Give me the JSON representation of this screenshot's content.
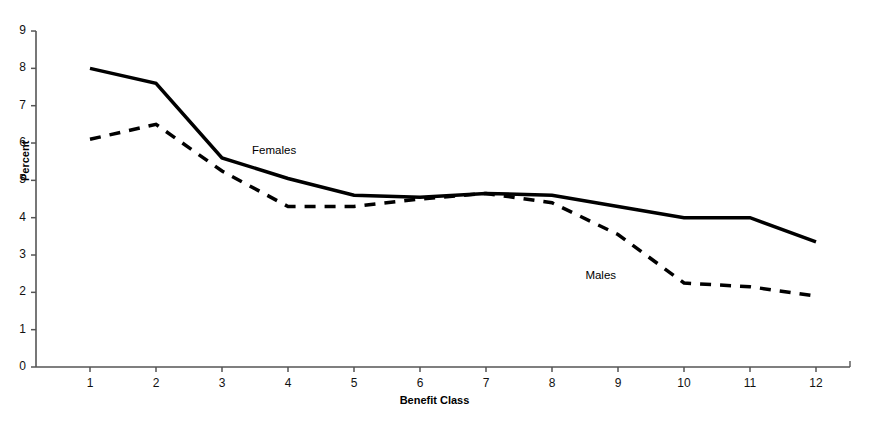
{
  "chart_data": {
    "type": "line",
    "title": "",
    "xlabel": "Benefit Class",
    "ylabel": "Percent",
    "categories": [
      "1",
      "2",
      "3",
      "4",
      "5",
      "6",
      "7",
      "8",
      "9",
      "10",
      "11",
      "12"
    ],
    "x": [
      1,
      2,
      3,
      4,
      5,
      6,
      7,
      8,
      9,
      10,
      11,
      12
    ],
    "xlim": [
      0.6,
      12.4
    ],
    "ylim": [
      0,
      9
    ],
    "yticks": [
      0,
      1,
      2,
      3,
      4,
      5,
      6,
      7,
      8,
      9
    ],
    "ytick_labels": [
      "0",
      "1",
      "2",
      "3",
      "4",
      "5",
      "6",
      "7",
      "8",
      "9"
    ],
    "xticks": [
      1,
      2,
      3,
      4,
      5,
      6,
      7,
      8,
      9,
      10,
      11,
      12
    ],
    "xtick_labels": [
      "1",
      "2",
      "3",
      "4",
      "5",
      "6",
      "7",
      "8",
      "9",
      "10",
      "11",
      "12"
    ],
    "grid": false,
    "legend_position": "inline-annotation",
    "series": [
      {
        "name": "Females",
        "style": "solid",
        "color": "#000000",
        "width": 3.5,
        "values": [
          8.0,
          7.6,
          5.6,
          5.05,
          4.6,
          4.55,
          4.65,
          4.6,
          4.3,
          4.0,
          4.0,
          3.35
        ]
      },
      {
        "name": "Males",
        "style": "dashed",
        "color": "#000000",
        "width": 3.5,
        "values": [
          6.1,
          6.5,
          5.25,
          4.3,
          4.3,
          4.5,
          4.65,
          4.4,
          3.55,
          2.25,
          2.15,
          1.9
        ]
      }
    ],
    "annotations": [
      {
        "text": "Females",
        "x": 3.85,
        "y": 5.75
      },
      {
        "text": "Males",
        "x": 8.9,
        "y": 2.4
      }
    ]
  },
  "axes": {
    "y_axis_color": "#555555",
    "x_axis_color": "#555555"
  }
}
